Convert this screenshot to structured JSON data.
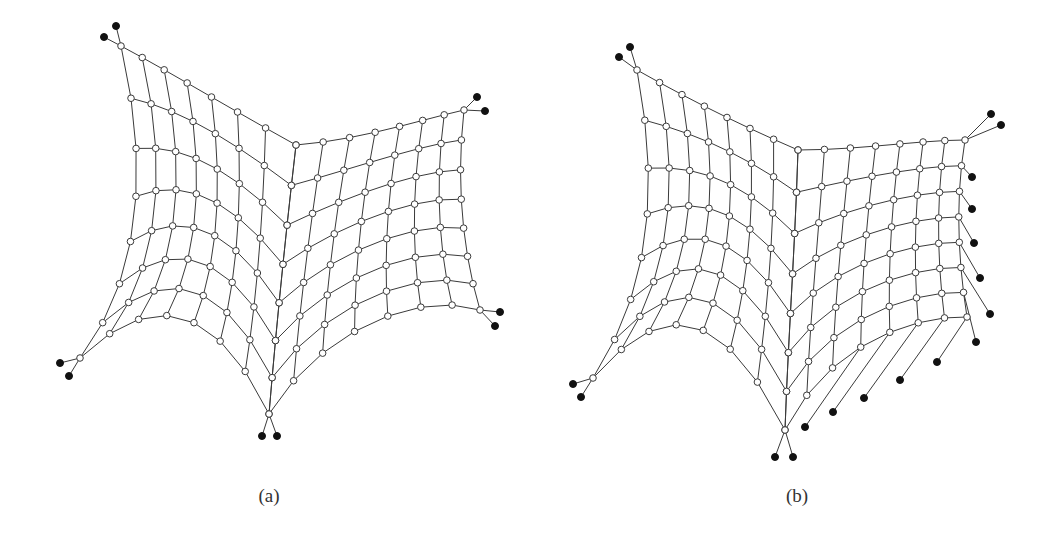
{
  "figures": [
    {
      "id": "a",
      "caption": "(a)",
      "caption_pos": [
        269,
        497
      ],
      "patches": [
        {
          "name": "left",
          "cols": 8,
          "rows": 8,
          "top": [
            [
              121,
              46
            ],
            [
              170,
              72
            ],
            [
              222,
              104
            ],
            [
              296,
              145
            ]
          ],
          "bottom": [
            [
              80,
              358
            ],
            [
              150,
              290
            ],
            [
              215,
              300
            ],
            [
              269,
              414
            ]
          ],
          "left": [
            [
              121,
              46
            ],
            [
              150,
              170
            ],
            [
              140,
              280
            ],
            [
              80,
              358
            ]
          ],
          "right": [
            [
              296,
              145
            ],
            [
              285,
              240
            ],
            [
              276,
              330
            ],
            [
              269,
              414
            ]
          ]
        },
        {
          "name": "right",
          "cols": 8,
          "rows": 8,
          "top": [
            [
              296,
              145
            ],
            [
              360,
              140
            ],
            [
              420,
              120
            ],
            [
              464,
              110
            ]
          ],
          "bottom": [
            [
              269,
              414
            ],
            [
              320,
              330
            ],
            [
              420,
              290
            ],
            [
              480,
              310
            ]
          ],
          "left": [
            [
              296,
              145
            ],
            [
              285,
              240
            ],
            [
              276,
              330
            ],
            [
              269,
              414
            ]
          ],
          "right": [
            [
              464,
              110
            ],
            [
              456,
              180
            ],
            [
              462,
              250
            ],
            [
              480,
              310
            ]
          ]
        }
      ],
      "anchors": [
        {
          "node": [
            121,
            46
          ],
          "fixed": [
            [
              116,
              26
            ],
            [
              104,
              37
            ]
          ]
        },
        {
          "node": [
            464,
            110
          ],
          "fixed": [
            [
              477,
              97
            ],
            [
              485,
              111
            ]
          ]
        },
        {
          "node": [
            80,
            358
          ],
          "fixed": [
            [
              60,
              363
            ],
            [
              69,
              376
            ]
          ]
        },
        {
          "node": [
            269,
            414
          ],
          "fixed": [
            [
              262,
              436
            ],
            [
              277,
              436
            ]
          ]
        },
        {
          "node": [
            480,
            310
          ],
          "fixed": [
            [
              500,
              312
            ],
            [
              495,
              326
            ]
          ]
        }
      ]
    },
    {
      "id": "b",
      "caption": "(b)",
      "caption_pos": [
        797,
        497
      ],
      "patches": [
        {
          "name": "left",
          "cols": 8,
          "rows": 8,
          "top": [
            [
              637,
              70
            ],
            [
              690,
              100
            ],
            [
              740,
              125
            ],
            [
              798,
              150
            ]
          ],
          "bottom": [
            [
              593,
              378
            ],
            [
              660,
              300
            ],
            [
              720,
              300
            ],
            [
              785,
              430
            ]
          ],
          "left": [
            [
              637,
              70
            ],
            [
              660,
              190
            ],
            [
              650,
              290
            ],
            [
              593,
              378
            ]
          ],
          "right": [
            [
              798,
              150
            ],
            [
              795,
              250
            ],
            [
              788,
              340
            ],
            [
              785,
              430
            ]
          ]
        },
        {
          "name": "right",
          "cols": 8,
          "rows": 8,
          "top": [
            [
              798,
              150
            ],
            [
              860,
              150
            ],
            [
              920,
              140
            ],
            [
              965,
              140
            ]
          ],
          "bottom": [
            [
              785,
              430
            ],
            [
              830,
              340
            ],
            [
              920,
              315
            ],
            [
              967,
              317
            ]
          ],
          "left": [
            [
              798,
              150
            ],
            [
              795,
              250
            ],
            [
              788,
              340
            ],
            [
              785,
              430
            ]
          ],
          "right": [
            [
              965,
              140
            ],
            [
              955,
              200
            ],
            [
              958,
              260
            ],
            [
              967,
              317
            ]
          ]
        }
      ],
      "anchors": [
        {
          "node": [
            637,
            70
          ],
          "fixed": [
            [
              630,
              47
            ],
            [
              619,
              57
            ]
          ]
        },
        {
          "node": [
            965,
            140
          ],
          "fixed": [
            [
              991,
              114
            ],
            [
              1001,
              125
            ]
          ]
        },
        {
          "node": [
            593,
            378
          ],
          "fixed": [
            [
              573,
              384
            ],
            [
              581,
              397
            ]
          ]
        },
        {
          "node": [
            785,
            430
          ],
          "fixed": [
            [
              775,
              457
            ],
            [
              793,
              457
            ]
          ]
        }
      ],
      "edge_anchors": [
        [
          972,
          177
        ],
        [
          972,
          209
        ],
        [
          974,
          243
        ],
        [
          980,
          278
        ],
        [
          990,
          314
        ],
        [
          976,
          342
        ],
        [
          937,
          362
        ],
        [
          900,
          380
        ],
        [
          864,
          398
        ],
        [
          833,
          412
        ],
        [
          805,
          427
        ]
      ]
    }
  ]
}
